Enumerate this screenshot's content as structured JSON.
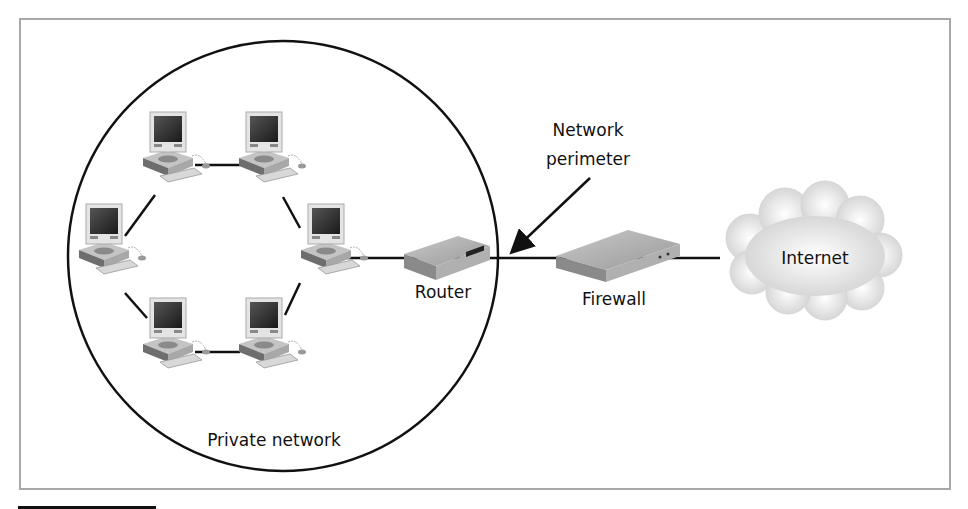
{
  "diagram": {
    "labels": {
      "private_network": "Private network",
      "router": "Router",
      "firewall": "Firewall",
      "internet": "Internet",
      "perimeter_line1": "Network",
      "perimeter_line2": "perimeter"
    },
    "nodes": [
      {
        "id": "pc1",
        "type": "computer"
      },
      {
        "id": "pc2",
        "type": "computer"
      },
      {
        "id": "pc3",
        "type": "computer"
      },
      {
        "id": "pc4",
        "type": "computer"
      },
      {
        "id": "pc5",
        "type": "computer"
      },
      {
        "id": "pc6",
        "type": "computer"
      },
      {
        "id": "router",
        "type": "router",
        "label": "Router"
      },
      {
        "id": "firewall",
        "type": "firewall",
        "label": "Firewall"
      },
      {
        "id": "internet",
        "type": "cloud",
        "label": "Internet"
      }
    ],
    "edges": [
      [
        "pc1",
        "pc2"
      ],
      [
        "pc2",
        "pc3"
      ],
      [
        "pc3",
        "pc6"
      ],
      [
        "pc6",
        "pc5"
      ],
      [
        "pc5",
        "pc4"
      ],
      [
        "pc4",
        "pc1"
      ],
      [
        "pc3",
        "router"
      ],
      [
        "router",
        "firewall"
      ],
      [
        "firewall",
        "internet"
      ]
    ],
    "colors": {
      "line": "#111111",
      "frame": "#a8a8a8",
      "device": "#9a9a9a",
      "cloud": "#e2e2e2"
    }
  }
}
